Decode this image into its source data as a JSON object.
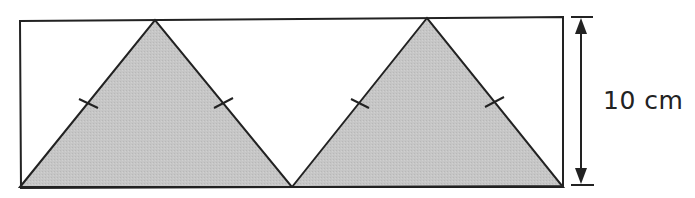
{
  "diagram": {
    "type": "geometry",
    "height_label": "10 cm",
    "colors": {
      "shade": "#c4c4c4",
      "stroke": "#222222",
      "background": "#ffffff"
    },
    "shapes": {
      "rectangle": {
        "x1": 20,
        "y1": 20,
        "x2": 563,
        "y2": 187
      },
      "triangles": [
        {
          "points": [
            [
              20,
              187
            ],
            [
              155,
              20
            ],
            [
              292,
              187
            ]
          ],
          "shaded": true
        },
        {
          "points": [
            [
              292,
              187
            ],
            [
              427,
              18
            ],
            [
              563,
              187
            ]
          ],
          "shaded": true
        }
      ]
    }
  }
}
